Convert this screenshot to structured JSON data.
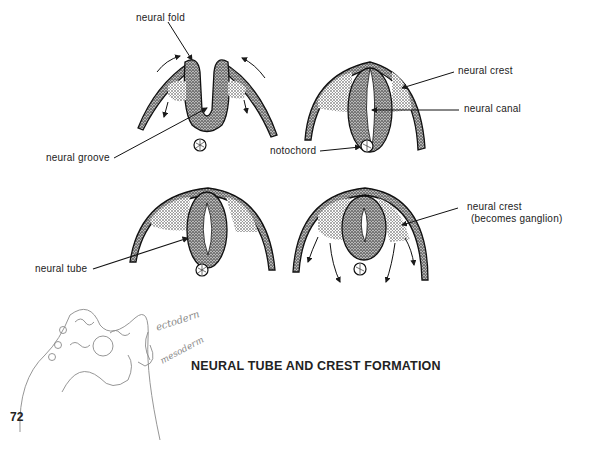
{
  "labels": {
    "neural_fold": "neural fold",
    "neural_groove": "neural groove",
    "neural_crest_top": "neural crest",
    "neural_canal": "neural canal",
    "notochord": "notochord",
    "neural_tube": "neural tube",
    "neural_crest_bottom_1": "neural crest",
    "neural_crest_bottom_2": "(becomes ganglion)"
  },
  "title": "NEURAL TUBE AND CREST FORMATION",
  "page_number": "72",
  "handwritten": {
    "ectoderm": "ectodern",
    "mesoderm": "mesoderm"
  },
  "colors": {
    "ink": "#1a1a1a",
    "stipple": "#555555",
    "pencil": "#8a8a8a",
    "background": "#ffffff"
  }
}
